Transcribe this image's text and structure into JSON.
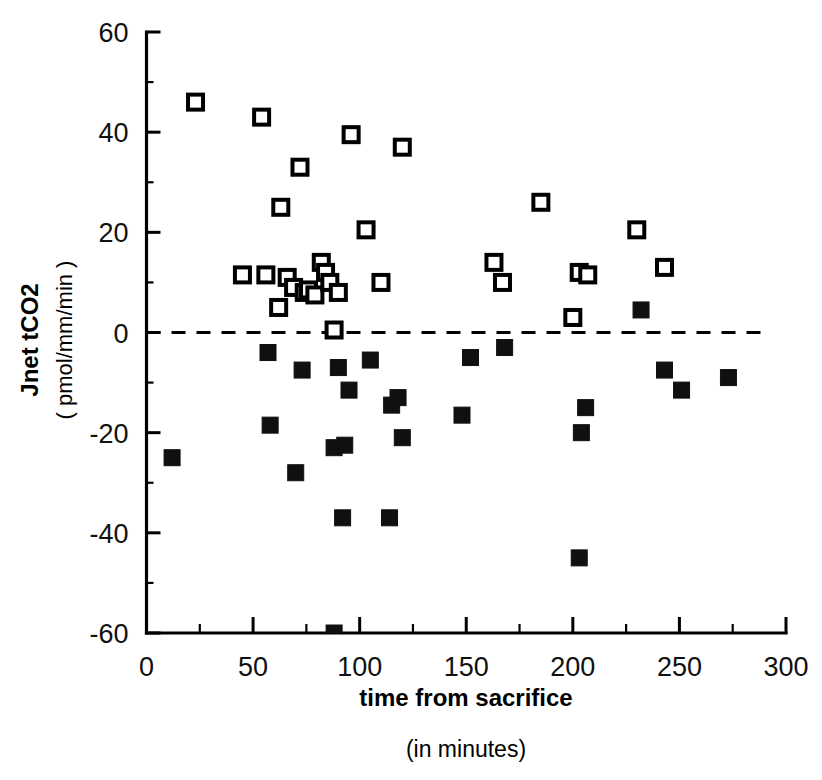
{
  "chart_data": {
    "type": "scatter",
    "title": "",
    "xlabel": "time from sacrifice",
    "xlabel_sub": "(in minutes)",
    "ylabel": "Jnet tCO2",
    "ylabel_sub": "( pmol/mm/min )",
    "xlim": [
      0,
      300
    ],
    "ylim": [
      -60,
      60
    ],
    "xticks": [
      0,
      50,
      100,
      150,
      200,
      250,
      300
    ],
    "xticklabels": [
      "0",
      "50",
      "100",
      "150",
      "200",
      "250",
      "300"
    ],
    "xminor_step": 25,
    "yticks": [
      -60,
      -40,
      -20,
      0,
      20,
      40,
      60
    ],
    "yticklabels": [
      "-60",
      "-40",
      "-20",
      "0",
      "20",
      "40",
      "60"
    ],
    "yminor_step": 10,
    "grid": false,
    "legend": "none",
    "annotations": [
      {
        "type": "hline",
        "y": 0,
        "style": "dashed",
        "label": "zero reference line"
      }
    ],
    "series": [
      {
        "name": "open-squares",
        "marker": "open square",
        "color": "#000000",
        "points": [
          [
            23,
            46
          ],
          [
            45,
            11.5
          ],
          [
            54,
            43
          ],
          [
            56,
            11.5
          ],
          [
            62,
            5
          ],
          [
            63,
            25
          ],
          [
            66,
            11
          ],
          [
            69,
            9
          ],
          [
            72,
            33
          ],
          [
            74,
            8
          ],
          [
            76,
            8.5
          ],
          [
            79,
            7.5
          ],
          [
            82,
            14
          ],
          [
            84,
            12
          ],
          [
            86,
            10
          ],
          [
            88,
            0.5
          ],
          [
            90,
            8
          ],
          [
            96,
            39.5
          ],
          [
            103,
            20.5
          ],
          [
            110,
            10
          ],
          [
            120,
            37
          ],
          [
            163,
            14
          ],
          [
            167,
            10
          ],
          [
            185,
            26
          ],
          [
            200,
            3
          ],
          [
            203,
            12
          ],
          [
            207,
            11.5
          ],
          [
            230,
            20.5
          ],
          [
            243,
            13
          ]
        ]
      },
      {
        "name": "filled-squares",
        "marker": "filled square",
        "color": "#101010",
        "points": [
          [
            12,
            -25
          ],
          [
            57,
            -4
          ],
          [
            58,
            -18.5
          ],
          [
            70,
            -28
          ],
          [
            73,
            -7.5
          ],
          [
            88,
            -23
          ],
          [
            88,
            -60
          ],
          [
            90,
            -7
          ],
          [
            92,
            -37
          ],
          [
            93,
            -22.5
          ],
          [
            95,
            -11.5
          ],
          [
            105,
            -5.5
          ],
          [
            114,
            -37
          ],
          [
            115,
            -14.5
          ],
          [
            118,
            -13
          ],
          [
            120,
            -21
          ],
          [
            148,
            -16.5
          ],
          [
            152,
            -5
          ],
          [
            168,
            -3
          ],
          [
            203,
            -45
          ],
          [
            204,
            -20
          ],
          [
            206,
            -15
          ],
          [
            232,
            4.5
          ],
          [
            243,
            -7.5
          ],
          [
            251,
            -11.5
          ],
          [
            273,
            -9
          ]
        ]
      }
    ]
  },
  "accent_color": "#000000"
}
